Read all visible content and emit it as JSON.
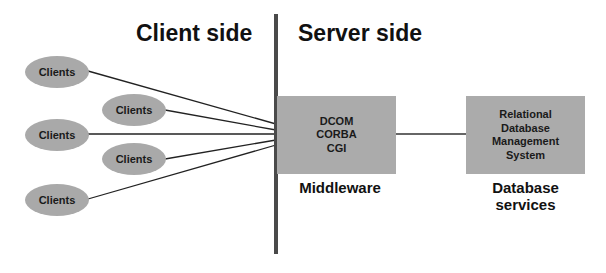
{
  "headings": {
    "client_side": "Client side",
    "server_side": "Server side"
  },
  "clients": [
    {
      "label": "Clients"
    },
    {
      "label": "Clients"
    },
    {
      "label": "Clients"
    },
    {
      "label": "Clients"
    },
    {
      "label": "Clients"
    }
  ],
  "middleware": {
    "lines": [
      "DCOM",
      "CORBA",
      "CGI"
    ],
    "caption": "Middleware"
  },
  "database": {
    "lines": [
      "Relational",
      "Database",
      "Management",
      "System"
    ],
    "caption_line1": "Database",
    "caption_line2": "services"
  },
  "colors": {
    "shape_fill": "#a9a9a9",
    "divider": "#4a4a4a",
    "text": "#111111"
  }
}
